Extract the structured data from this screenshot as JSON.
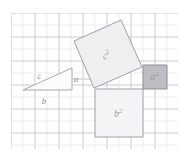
{
  "figure": {
    "name": "pythagorean-theorem-diagram",
    "background_color": "#ffffff"
  },
  "grid": {
    "x": 11,
    "y": 13,
    "width": 167,
    "height": 136,
    "cell_size": 12,
    "columns": 14,
    "rows": 11,
    "minor_line_color": "#e8e8ec",
    "major_line_color": "#c9c9d2",
    "major_every": 2
  },
  "labels": {
    "leg_a": "a",
    "leg_b": "b",
    "hypotenuse_c": "c",
    "square_a": "a",
    "square_b": "b",
    "square_c": "c",
    "exponent": "2"
  },
  "triangle": {
    "name": "right-triangle",
    "points": "23,90 72,90 72,68",
    "fill": "#fbfbfc",
    "stroke": "#a9a9b2",
    "legs": {
      "a_vertical": {
        "x1": 72,
        "y1": 68,
        "x2": 72,
        "y2": 90
      },
      "b_horizontal": {
        "x1": 23,
        "y1": 90,
        "x2": 72,
        "y2": 90
      },
      "c_hypotenuse": {
        "x1": 23,
        "y1": 90,
        "x2": 72,
        "y2": 68
      }
    },
    "label_positions": {
      "a": {
        "x": 76,
        "y": 82
      },
      "b": {
        "x": 44,
        "y": 104
      },
      "c": {
        "x": 40,
        "y": 79
      }
    }
  },
  "squares": [
    {
      "name": "square-on-hypotenuse-c",
      "label": "c",
      "exponent": "2",
      "points": "94,88 74,41 121,20 142,67",
      "fill": "#efeff1",
      "stroke": "#a0a0a9",
      "label_x": 104,
      "label_y": 60,
      "tilted": true
    },
    {
      "name": "square-on-leg-b",
      "label": "b",
      "exponent": "2",
      "points": "95,89 143,89 143,137 95,137",
      "fill": "#f4f4f6",
      "stroke": "#a0a0a9",
      "label_x": 114,
      "label_y": 117,
      "tilted": false
    },
    {
      "name": "square-on-leg-a",
      "label": "a",
      "exponent": "2",
      "points": "143,65 167,65 167,89 143,89",
      "fill": "#bdbdc4",
      "stroke": "#8f8f98",
      "label_x": 150,
      "label_y": 80,
      "tilted": false
    }
  ],
  "connector_lines": [
    {
      "name": "leg-a-extension",
      "x1": 72,
      "y1": 79,
      "x2": 94,
      "y2": 79
    }
  ]
}
